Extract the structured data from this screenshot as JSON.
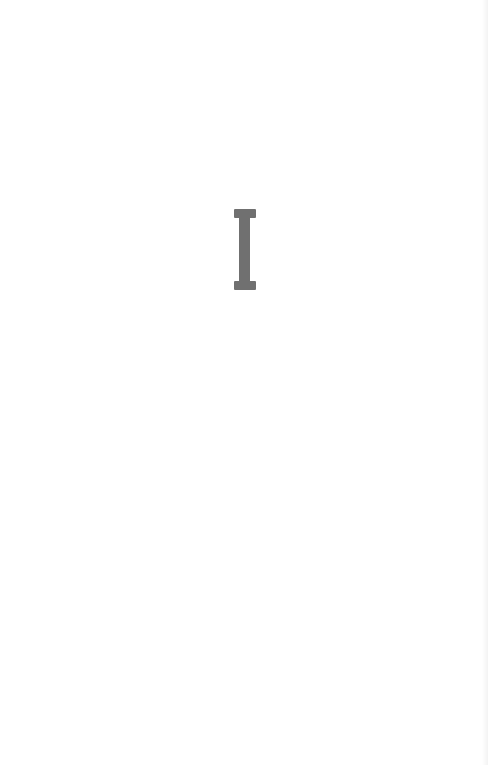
{
  "page": {
    "section_numeral": "I",
    "numeral_color": "#707070",
    "background_color": "#ffffff"
  }
}
